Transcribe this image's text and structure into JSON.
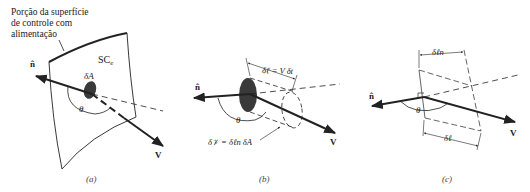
{
  "colors": {
    "ink": "#222222",
    "blob": "#3a3a3a",
    "background": "#ffffff"
  },
  "panel_a": {
    "annotation_line1": "Porção da superfície",
    "annotation_line2": "de controle com",
    "annotation_line3": "alimentação",
    "surface_label": "SC",
    "surface_subscript": "e",
    "area_label": "δA",
    "normal_label": "n̂",
    "angle_label": "θ",
    "velocity_label": "V",
    "caption": "(a)"
  },
  "panel_b": {
    "length_label": "δℓ = V δt",
    "volume_label": "δ𝒱 = δℓn δA",
    "normal_label": "n̂",
    "angle_label": "θ",
    "velocity_label": "V",
    "caption": "(b)"
  },
  "panel_c": {
    "normal_length_label": "δℓn",
    "length_label": "δℓ",
    "normal_label": "n̂",
    "angle_label": "θ",
    "velocity_label": "V",
    "caption": "(c)"
  }
}
